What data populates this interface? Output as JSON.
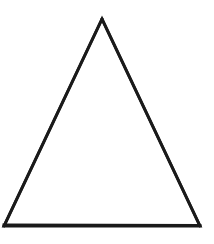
{
  "canvas": {
    "width": 214,
    "height": 244,
    "background_color": "#ffffff",
    "label": "white-drawing-canvas"
  },
  "figure": {
    "name": "triangle",
    "shape_type": "triangle",
    "fill_color": "#ffffff",
    "stroke_color": "#1a1a1a",
    "stroke_width": 3,
    "stroke_linejoin": "miter",
    "vertices": [
      {
        "name": "apex",
        "x": 102,
        "y": 19
      },
      {
        "name": "bottom-right",
        "x": 200,
        "y": 226
      },
      {
        "name": "bottom-left",
        "x": 4,
        "y": 226
      }
    ],
    "points_attr": "102,19 200,226 4,226",
    "edges": [
      {
        "name": "left-edge",
        "from": "apex",
        "to": "bottom-left"
      },
      {
        "name": "right-edge",
        "from": "apex",
        "to": "bottom-right"
      },
      {
        "name": "base-edge",
        "from": "bottom-left",
        "to": "bottom-right"
      }
    ],
    "measurements": {
      "base_width": 196,
      "height": 207,
      "apex_offset_from_base_center": 0
    }
  }
}
